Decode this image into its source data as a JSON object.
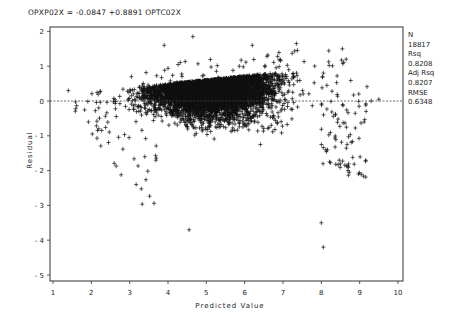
{
  "chart_data": {
    "type": "scatter",
    "title": "OPXP02X = -0.0847 +0.8891 OPTC02X",
    "xlabel": "Predicted Value",
    "ylabel": "Residual",
    "xlim": [
      1,
      10
    ],
    "ylim": [
      -5,
      2
    ],
    "x_ticks": [
      "1",
      "2",
      "3",
      "4",
      "5",
      "6",
      "7",
      "8",
      "9",
      "10"
    ],
    "y_ticks": [
      "2",
      "1",
      "0",
      "-1",
      "-2",
      "-3",
      "-4",
      "-5"
    ],
    "reference_line": {
      "y": 0,
      "style": "dashed"
    },
    "grid": false,
    "marker": "+",
    "regression": {
      "intercept": -0.0847,
      "slope": 0.8891,
      "dependent": "OPXP02X",
      "independent": "OPTC02X"
    },
    "stats": {
      "n_label": "N",
      "n_value": "18817",
      "rsq_label": "Rsq",
      "rsq_value": "0.8208",
      "adjrsq_label": "Adj Rsq",
      "adjrsq_value": "0.8207",
      "rmse_label": "RMSE",
      "rmse_value": "0.6348"
    },
    "cloud_description": {
      "x_range_dense": [
        3,
        8.5
      ],
      "upper_boundary": "residual rises linearly from ~0.3 at x=1.5 to ~1.0 at x=8.5 (censoring ceiling)",
      "lower_tail": "extends down to about -3 in the x 4-8 range",
      "notable_points": [
        {
          "x": 4.65,
          "y": 1.85
        },
        {
          "x": 3.9,
          "y": 1.6
        },
        {
          "x": 6.2,
          "y": 1.6
        },
        {
          "x": 7.35,
          "y": 1.65
        },
        {
          "x": 8.55,
          "y": 1.5
        },
        {
          "x": 4.55,
          "y": -3.7
        },
        {
          "x": 8.05,
          "y": -4.2
        },
        {
          "x": 8.0,
          "y": -3.5
        },
        {
          "x": 9.3,
          "y": 0.0
        },
        {
          "x": 9.5,
          "y": 0.05
        },
        {
          "x": 1.4,
          "y": 0.3
        }
      ]
    }
  },
  "labels": {
    "title": "OPXP02X = -0.0847 +0.8891 OPTC02X",
    "xlabel": "Predicted Value",
    "ylabel": "Residual"
  }
}
